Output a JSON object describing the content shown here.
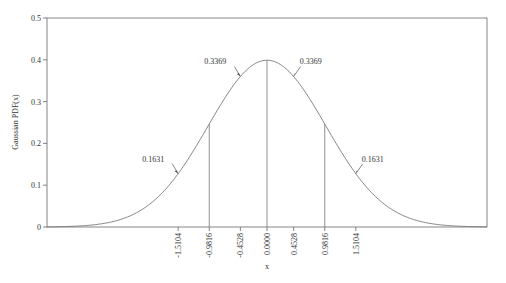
{
  "chart_data": {
    "type": "line",
    "title": "",
    "xlabel": "x",
    "ylabel": "Gaussian PDF(x)",
    "xlim": [
      -3.74,
      3.74
    ],
    "ylim": [
      0,
      0.5
    ],
    "grid": false,
    "legend": null,
    "series": [
      {
        "name": "Gaussian PDF",
        "function": "standard normal N(0,1)",
        "color": "#555555"
      }
    ],
    "y_ticks": [
      0,
      0.1,
      0.2,
      0.3,
      0.4,
      0.5
    ],
    "y_tick_labels": [
      "0",
      "0.1",
      "0.2",
      "0.3",
      "0.4",
      "0.5"
    ],
    "x_ticks": [
      -1.5104,
      -0.9816,
      -0.4528,
      0.0,
      0.4528,
      0.9816,
      1.5104
    ],
    "x_tick_labels": [
      "-1.5104",
      "-0.9816",
      "-0.4528",
      "0.0000",
      "0.4528",
      "0.9816",
      "1.5104"
    ],
    "vertical_lines": [
      -0.9816,
      0.0,
      0.9816
    ],
    "annotations": [
      {
        "x": -0.4528,
        "y": 0.3369,
        "text": "0.3369",
        "side": "left"
      },
      {
        "x": 0.4528,
        "y": 0.3369,
        "text": "0.3369",
        "side": "right"
      },
      {
        "x": -1.5104,
        "y": 0.1631,
        "text": "0.1631",
        "side": "left"
      },
      {
        "x": 1.5104,
        "y": 0.1631,
        "text": "0.1631",
        "side": "right"
      }
    ]
  }
}
